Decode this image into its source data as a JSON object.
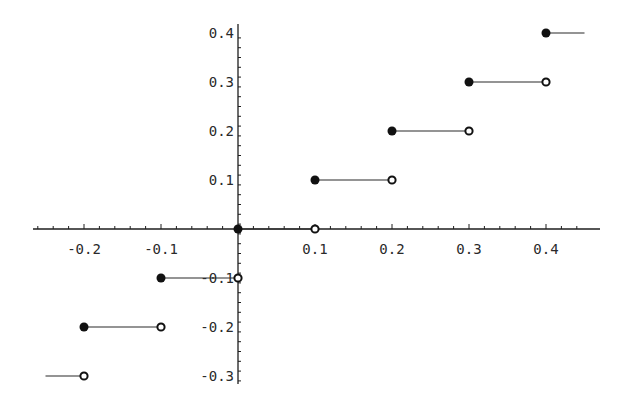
{
  "chart_data": {
    "type": "line",
    "title": "",
    "xlabel": "",
    "ylabel": "",
    "xlim": [
      -0.27,
      0.46
    ],
    "ylim": [
      -0.31,
      0.41
    ],
    "grid": false,
    "legend": null,
    "x_ticks": [
      -0.2,
      -0.1,
      0.1,
      0.2,
      0.3,
      0.4
    ],
    "x_tick_labels": [
      "-0.2",
      "-0.1",
      "0.1",
      "0.2",
      "0.3",
      "0.4"
    ],
    "y_ticks": [
      0.4,
      0.3,
      0.2,
      0.1,
      -0.1,
      -0.2,
      -0.3
    ],
    "y_tick_labels": [
      "0.4",
      "0.3",
      "0.2",
      "0.1",
      "-0.1",
      "-0.2",
      "-0.3"
    ],
    "segments": [
      {
        "x_start": -0.25,
        "x_end": -0.2,
        "y": -0.3,
        "start_marker": "none",
        "end_marker": "open"
      },
      {
        "x_start": -0.2,
        "x_end": -0.1,
        "y": -0.2,
        "start_marker": "closed",
        "end_marker": "open"
      },
      {
        "x_start": -0.1,
        "x_end": 0.0,
        "y": -0.1,
        "start_marker": "closed",
        "end_marker": "open"
      },
      {
        "x_start": 0.0,
        "x_end": 0.1,
        "y": 0.0,
        "start_marker": "closed",
        "end_marker": "open"
      },
      {
        "x_start": 0.1,
        "x_end": 0.2,
        "y": 0.1,
        "start_marker": "closed",
        "end_marker": "open"
      },
      {
        "x_start": 0.2,
        "x_end": 0.3,
        "y": 0.2,
        "start_marker": "closed",
        "end_marker": "open"
      },
      {
        "x_start": 0.3,
        "x_end": 0.4,
        "y": 0.3,
        "start_marker": "closed",
        "end_marker": "open"
      },
      {
        "x_start": 0.4,
        "x_end": 0.45,
        "y": 0.4,
        "start_marker": "closed",
        "end_marker": "none"
      }
    ]
  },
  "style": {
    "line_color": "#2b2b2b",
    "axis_color": "#1e1e1e",
    "background": "#ffffff"
  }
}
